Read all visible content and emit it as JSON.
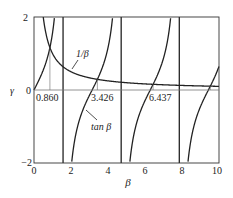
{
  "chart_data": {
    "type": "line",
    "title": "",
    "xlabel": "β",
    "ylabel": "γ",
    "xlim": [
      0,
      10
    ],
    "ylim": [
      -2,
      2
    ],
    "x_ticks": [
      "0",
      "2",
      "4",
      "6",
      "8",
      "10"
    ],
    "y_ticks": [
      "−2",
      "0",
      "2"
    ],
    "grid": false,
    "series": [
      {
        "name": "1/β",
        "function": "1/beta"
      },
      {
        "name": "tan β",
        "function": "tan(beta)"
      }
    ],
    "asymptotes": [
      1.5708,
      4.7124,
      7.854
    ],
    "intersections": [
      {
        "x": 0.86,
        "label": "0.860"
      },
      {
        "x": 3.426,
        "label": "3.426"
      },
      {
        "x": 6.437,
        "label": "6.437"
      },
      {
        "x": 9.529,
        "label": ""
      }
    ],
    "annotations": [
      {
        "text": "1/β",
        "target": "1/β curve"
      },
      {
        "text": "tan β",
        "target": "tan β curve"
      }
    ]
  },
  "labels": {
    "xlabel": "β",
    "ylabel": "γ",
    "y_top": "2",
    "y_zero": "0",
    "y_bottom": "−2",
    "x0": "0",
    "x2": "2",
    "x4": "4",
    "x6": "6",
    "x8": "8",
    "x10": "10",
    "root1": "0.860",
    "root2": "3.426",
    "root3": "6.437",
    "inv_label": "1/β",
    "tan_label": "tan β"
  }
}
